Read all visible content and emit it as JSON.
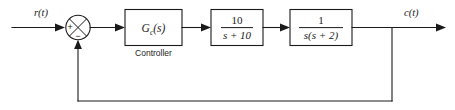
{
  "diagram": {
    "input_signal": "r(t)",
    "output_signal": "c(t)",
    "summing_junction": {
      "name": "summing-junction",
      "plus_sign": "+",
      "minus_sign": "−",
      "plus_position": "left",
      "minus_position": "bottom",
      "marker": "cross"
    },
    "blocks": [
      {
        "id": "controller",
        "label_main": "G",
        "label_sub": "c",
        "label_tail": "(s)",
        "caption": "Controller",
        "is_fraction": false,
        "numerator": "",
        "denominator": ""
      },
      {
        "id": "plant-lag",
        "label_main": "",
        "label_sub": "",
        "label_tail": "",
        "caption": "",
        "is_fraction": true,
        "numerator": "10",
        "denominator": "s + 10"
      },
      {
        "id": "plant-integrator",
        "label_main": "",
        "label_sub": "",
        "label_tail": "",
        "caption": "",
        "is_fraction": true,
        "numerator": "1",
        "denominator": "s(s + 2)"
      }
    ],
    "feedback": {
      "label": "",
      "type": "unity",
      "path": "output-takeoff-to-summing-junction"
    },
    "colors": {
      "line": "#1a1a1a",
      "background": "#ffffff",
      "block_fill": "#ffffff"
    }
  }
}
